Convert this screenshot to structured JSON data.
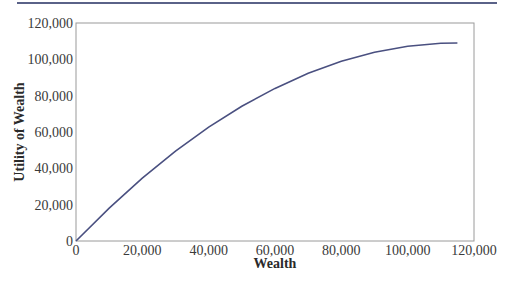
{
  "chart_data": {
    "type": "line",
    "title": "",
    "xlabel": "Wealth",
    "ylabel": "Utility of Wealth",
    "xlim": [
      0,
      120000
    ],
    "ylim": [
      0,
      120000
    ],
    "x_ticks": [
      "0",
      "20,000",
      "40,000",
      "60,000",
      "80,000",
      "100,000",
      "120,000"
    ],
    "y_ticks": [
      "0",
      "20,000",
      "40,000",
      "60,000",
      "80,000",
      "100,000",
      "120,000"
    ],
    "x_tick_values": [
      0,
      20000,
      40000,
      60000,
      80000,
      100000,
      120000
    ],
    "y_tick_values": [
      0,
      20000,
      40000,
      60000,
      80000,
      100000,
      120000
    ],
    "grid": false,
    "legend": null,
    "series": [
      {
        "name": "Utility of Wealth",
        "color": "#4a5080",
        "x": [
          0,
          10000,
          20000,
          30000,
          40000,
          50000,
          60000,
          70000,
          80000,
          90000,
          100000,
          110000,
          115000
        ],
        "values": [
          0,
          18100,
          34600,
          49500,
          62700,
          74200,
          84000,
          92300,
          98900,
          103900,
          107200,
          108900,
          109000
        ]
      }
    ]
  },
  "page": {
    "top_rule_color": "#5a6288",
    "axis_color": "#8a8a8a"
  }
}
